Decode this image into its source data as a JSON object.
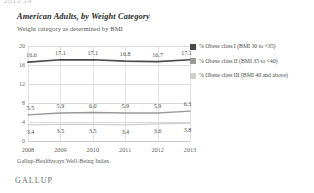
{
  "clipped_fragment": "2012 14",
  "header": {
    "title": "American Adults, by Weight Category",
    "subtitle": "Weight category as determined by BMI"
  },
  "footer": {
    "source": "Gallup-Healthways Well-Being Index",
    "brand": "GALLUP"
  },
  "colors": {
    "class_i": "#4a4a4a",
    "class_ii": "#9a9a9a",
    "class_iii": "#cfcfcf",
    "grid": "#dcdcdc",
    "text": "#4c4c4c",
    "background": "#ffffff"
  },
  "chart_data": {
    "type": "line",
    "title": "American Adults, by Weight Category",
    "subtitle": "Weight category as determined by BMI",
    "xlabel": "",
    "ylabel": "",
    "x": [
      "2008",
      "2009",
      "2010",
      "2011",
      "2012",
      "2013"
    ],
    "categories": [
      "2008",
      "2009",
      "2010",
      "2011",
      "2012",
      "2013"
    ],
    "yticks": [
      0,
      4,
      8,
      12,
      16,
      20
    ],
    "ylim": [
      0,
      20
    ],
    "grid": true,
    "legend_position": "right",
    "series": [
      {
        "name": "% Obese class I (BMI 30 to <35)",
        "color": "#4a4a4a",
        "values": [
          16.6,
          17.1,
          17.1,
          16.8,
          16.7,
          17.1
        ],
        "labels": [
          "16.6",
          "17.1",
          "17.1",
          "16.8",
          "16.7",
          "17.1"
        ]
      },
      {
        "name": "% Obese class II (BMI 35 to <40)",
        "color": "#9a9a9a",
        "values": [
          5.5,
          5.9,
          6.0,
          5.9,
          5.9,
          6.3
        ],
        "labels": [
          "5.5",
          "5.9",
          "6.0",
          "5.9",
          "5.9",
          "6.3"
        ]
      },
      {
        "name": "% Obese class III (BMI 40 and above)",
        "color": "#cfcfcf",
        "values": [
          3.4,
          3.5,
          3.5,
          3.4,
          3.6,
          3.8
        ],
        "labels": [
          "3.4",
          "3.5",
          "3.5",
          "3.4",
          "3.6",
          "3.8"
        ]
      }
    ]
  }
}
